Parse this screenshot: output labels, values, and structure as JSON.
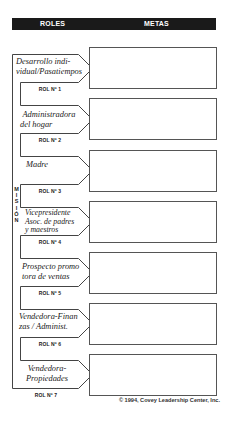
{
  "header": {
    "roles_label": "ROLES",
    "goals_label": "METAS"
  },
  "mission_label": [
    "M",
    "I",
    "S",
    "I",
    "Ó",
    "N"
  ],
  "roles": [
    {
      "lines": [
        "Desarrollo indi-",
        "vidual/Pasatiempos"
      ],
      "number_label": "ROL Nº 1",
      "goals": ""
    },
    {
      "lines": [
        "Administradora",
        "del hogar"
      ],
      "number_label": "ROL Nº 2",
      "goals": ""
    },
    {
      "lines": [
        "Madre"
      ],
      "number_label": "ROL Nº 3",
      "goals": ""
    },
    {
      "lines": [
        "Vicepresidente",
        "Asoc. de padres",
        "y maestros"
      ],
      "number_label": "ROL Nº 4",
      "goals": ""
    },
    {
      "lines": [
        "Prospecto promo",
        "tora de ventas"
      ],
      "number_label": "ROL Nº 5",
      "goals": ""
    },
    {
      "lines": [
        "Vendedora-Finan",
        "zas / Administ."
      ],
      "number_label": "ROL Nº 6",
      "goals": ""
    },
    {
      "lines": [
        "Vendedora-",
        "Propiedades"
      ],
      "number_label": "ROL Nº 7",
      "goals": ""
    }
  ],
  "copyright": "© 1994, Covey Leadership Center, Inc."
}
